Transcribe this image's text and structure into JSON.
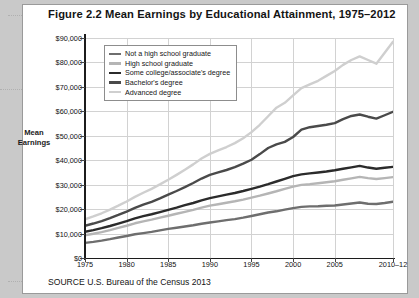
{
  "figure": {
    "title": "Figure 2.2  Mean Earnings by Educational Attainment, 1975–2012",
    "source_label": "SOURCE",
    "source_text": "U.S. Bureau of the Census 2013",
    "axis_label_line1": "Mean",
    "axis_label_line2": "Earnings"
  },
  "colors": {
    "not_hs": "#6e6e6e",
    "hs_grad": "#b5b5b5",
    "some_college": "#2b2b2b",
    "bachelors": "#4a4a4a",
    "advanced": "#cfcfcf",
    "axis": "#1c1c1c",
    "grid": "#d2d2d2",
    "sheet": "#ffffff",
    "page": "#c9c9c9"
  },
  "chart_data": {
    "type": "line",
    "title": "Mean Earnings by Educational Attainment, 1975–2012",
    "xlabel": "",
    "ylabel": "Mean Earnings",
    "ylim": [
      0,
      90000
    ],
    "yticks": [
      0,
      10000,
      20000,
      30000,
      40000,
      50000,
      60000,
      70000,
      80000,
      90000
    ],
    "ytick_labels": [
      "$0",
      "$10,000",
      "$20,000",
      "$30,000",
      "$40,000",
      "$50,000",
      "$60,000",
      "$70,000",
      "$80,000",
      "$90,000"
    ],
    "xlim": [
      1975,
      2012
    ],
    "xticks": [
      1975,
      1980,
      1985,
      1990,
      1995,
      2000,
      2005,
      2012
    ],
    "xtick_labels": [
      "1975",
      "1980",
      "1985",
      "1990",
      "1995",
      "2000",
      "2005",
      "2010–12"
    ],
    "grid": true,
    "legend_position": "top-left-inside",
    "x": [
      1975,
      1976,
      1977,
      1978,
      1979,
      1980,
      1981,
      1982,
      1983,
      1984,
      1985,
      1986,
      1987,
      1988,
      1989,
      1990,
      1991,
      1992,
      1993,
      1994,
      1995,
      1996,
      1997,
      1998,
      1999,
      2000,
      2001,
      2002,
      2003,
      2004,
      2005,
      2006,
      2007,
      2008,
      2009,
      2010,
      2011,
      2012
    ],
    "series": [
      {
        "name": "Not a high school graduate",
        "color": "#6e6e6e",
        "values": [
          6200,
          6600,
          7100,
          7700,
          8400,
          9000,
          9700,
          10200,
          10700,
          11300,
          11900,
          12400,
          12900,
          13400,
          14000,
          14500,
          15000,
          15500,
          15900,
          16500,
          17200,
          17900,
          18600,
          19100,
          19800,
          20400,
          20900,
          21100,
          21200,
          21400,
          21500,
          21900,
          22300,
          22700,
          22200,
          22100,
          22500,
          23000
        ]
      },
      {
        "name": "High school graduate",
        "color": "#b5b5b5",
        "values": [
          9300,
          9900,
          10600,
          11400,
          12300,
          13200,
          14200,
          15000,
          15700,
          16500,
          17300,
          18100,
          18900,
          19700,
          20600,
          21400,
          22000,
          22600,
          23200,
          23900,
          24700,
          25500,
          26400,
          27300,
          28300,
          29200,
          29900,
          30200,
          30600,
          31000,
          31400,
          32000,
          32600,
          33200,
          32700,
          32300,
          32700,
          33100
        ]
      },
      {
        "name": "Some college/associate's degree",
        "color": "#2b2b2b",
        "values": [
          10700,
          11400,
          12200,
          13100,
          14100,
          15100,
          16200,
          17100,
          17900,
          18800,
          19700,
          20600,
          21600,
          22500,
          23600,
          24500,
          25200,
          25900,
          26600,
          27400,
          28300,
          29200,
          30200,
          31300,
          32400,
          33500,
          34200,
          34600,
          35000,
          35400,
          35900,
          36500,
          37100,
          37700,
          37000,
          36500,
          36900,
          37300
        ]
      },
      {
        "name": "Bachelor's degree",
        "color": "#4a4a4a",
        "values": [
          13200,
          14100,
          15100,
          16300,
          17600,
          19000,
          20500,
          21800,
          23000,
          24400,
          25900,
          27400,
          29000,
          30700,
          32500,
          34000,
          35000,
          36000,
          37200,
          38600,
          40200,
          42500,
          45000,
          46500,
          47500,
          49500,
          52500,
          53500,
          54000,
          54500,
          55200,
          56800,
          58100,
          58700,
          57800,
          57000,
          58400,
          59800
        ]
      },
      {
        "name": "Advanced degree",
        "color": "#cfcfcf",
        "values": [
          15800,
          17000,
          18300,
          19800,
          21400,
          23100,
          25000,
          26700,
          28300,
          30100,
          32000,
          34000,
          36100,
          38300,
          40700,
          42600,
          44000,
          45400,
          47000,
          49000,
          51500,
          54500,
          58000,
          61500,
          63500,
          66500,
          69500,
          71000,
          72500,
          74500,
          76500,
          79000,
          81000,
          82500,
          81000,
          79500,
          84000,
          88500
        ]
      }
    ]
  },
  "legend": {
    "items": [
      {
        "label": "Not a high school graduate",
        "color": "#6e6e6e"
      },
      {
        "label": "High school graduate",
        "color": "#b5b5b5"
      },
      {
        "label": "Some college/associate's degree",
        "color": "#2b2b2b"
      },
      {
        "label": "Bachelor's degree",
        "color": "#4a4a4a"
      },
      {
        "label": "Advanced degree",
        "color": "#cfcfcf"
      }
    ]
  }
}
